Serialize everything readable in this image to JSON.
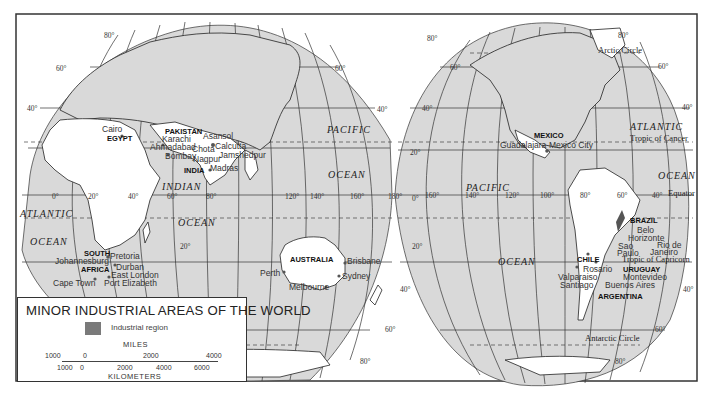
{
  "map": {
    "title": "MINOR INDUSTRIAL AREAS OF THE WORLD",
    "legend": {
      "swatch_label": "Industrial region",
      "swatch_color": "#7a7a7a",
      "scale": {
        "miles_label": "MILES",
        "miles_ticks": [
          "1000",
          "0",
          "2000",
          "4000"
        ],
        "km_label": "KILOMETERS",
        "km_ticks": [
          "1000",
          "0",
          "2000",
          "4000",
          "6000"
        ]
      }
    },
    "colors": {
      "ocean": "#d9d9d9",
      "land": "#ffffff",
      "industrial": "#555555",
      "frame": "#333333"
    },
    "oceans": {
      "atlantic_east": [
        "ATLANTIC",
        "OCEAN"
      ],
      "indian": [
        "INDIAN",
        "OCEAN"
      ],
      "pacific_east": [
        "PACIFIC",
        "OCEAN"
      ],
      "pacific_west": [
        "PACIFIC",
        "OCEAN"
      ],
      "atlantic_west": [
        "ATLANTIC",
        "OCEAN"
      ]
    },
    "reference_lines": {
      "arctic_circle": "Arctic Circle",
      "tropic_cancer": "Tropic of Cancer",
      "equator": "Equator",
      "tropic_capricorn": "Tropic of Capricorn",
      "antarctic_circle": "Antarctic Circle"
    },
    "countries": {
      "pakistan": "PAKISTAN",
      "egypt": "EGYPT",
      "india": "INDIA",
      "south_africa_1": "SOUTH",
      "south_africa_2": "AFRICA",
      "australia": "AUSTRALIA",
      "mexico": "MEXICO",
      "brazil": "BRAZIL",
      "chile": "CHILE",
      "uruguay": "URUGUAY",
      "argentina": "ARGENTINA"
    },
    "cities": {
      "cairo": "Cairo",
      "karachi": "Karachi",
      "ahmadabad": "Ahmadabad",
      "bombay": "Bombay",
      "asansol": "Asansol",
      "calcutta": "Calcutta",
      "chota": "Chota",
      "nagpur": "Nagpur",
      "jamshedpur": "Jamshedpur",
      "madras": "Madras",
      "pretoria": "Pretoria",
      "johannesburg": "Johannesburg",
      "durban": "Durban",
      "east_london": "East London",
      "port_elizabeth": "Port Elizabeth",
      "cape_town": "Cape Town",
      "perth": "Perth",
      "brisbane": "Brisbane",
      "sydney": "Sydney",
      "melbourne": "Melbourne",
      "guadalajara": "Guadalajara",
      "mexico_city": "Mexico City",
      "belo_horizonte_1": "Belo",
      "belo_horizonte_2": "Horizonte",
      "rio_1": "Rio de",
      "rio_2": "Janeiro",
      "sao_paulo_1": "Sao",
      "sao_paulo_2": "Paulo",
      "rosario": "Rosario",
      "valparaiso": "Valparaiso",
      "santiago": "Santiago",
      "montevideo": "Montevideo",
      "buenos_aires": "Buenos Aires"
    },
    "degrees": {
      "lat80": "80°",
      "lat60": "60°",
      "lat40": "40°",
      "lat20": "20°",
      "lat0": "0°",
      "lon0": "0°",
      "lon20": "20°",
      "lon40": "40°",
      "lon60": "60°",
      "lon80": "80°",
      "lon120": "120°",
      "lon140": "140°",
      "lon160": "160°",
      "lon180": "180°",
      "lon100": "100°"
    }
  }
}
